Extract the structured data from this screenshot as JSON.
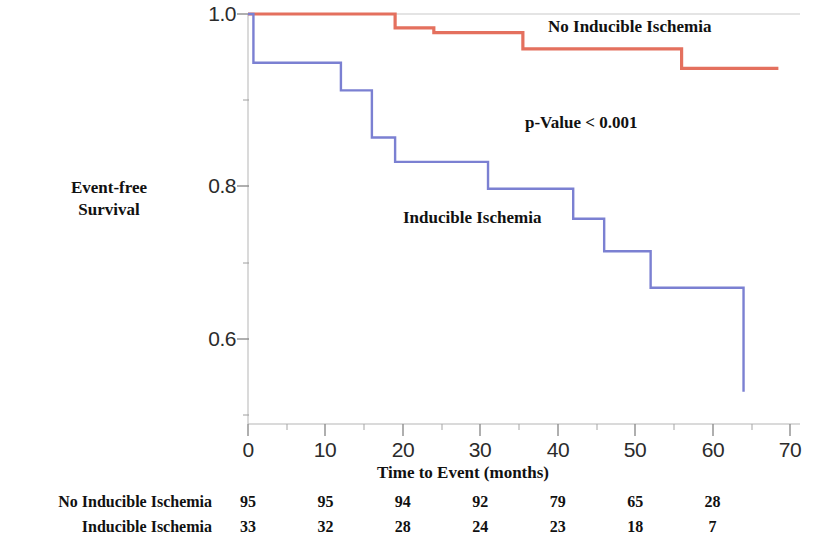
{
  "chart_data": {
    "type": "line",
    "subtype": "kaplan-meier-step",
    "title": "",
    "xlabel": "Time to Event (months)",
    "ylabel": "Event-free Survival",
    "ylabel_lines": [
      "Event-free",
      "Survival"
    ],
    "xlim": [
      0,
      70
    ],
    "ylim": [
      0.52,
      1.0
    ],
    "xticks": [
      0,
      10,
      20,
      30,
      40,
      50,
      60,
      70
    ],
    "xtick_labels": [
      "0",
      "10",
      "20",
      "30",
      "40",
      "50",
      "60",
      "70"
    ],
    "yticks": [
      0.6,
      0.8,
      1.0
    ],
    "ytick_labels": [
      "0.6",
      "0.8",
      "1.0"
    ],
    "y_minor_ticks": [
      0.7,
      0.9
    ],
    "grid": false,
    "legend_position": "in-plot-annotations",
    "annotations": [
      {
        "name": "no-inducible-ischemia-label",
        "text": "No Inducible Ischemia",
        "x": 39,
        "y": 0.978
      },
      {
        "name": "p-value-label",
        "text": "p-Value < 0.001",
        "x": 36,
        "y": 0.862
      },
      {
        "name": "inducible-ischemia-label",
        "text": "Inducible Ischemia",
        "x": 20,
        "y": 0.745
      }
    ],
    "series": [
      {
        "name": "No Inducible Ischemia",
        "color": "#e4705e",
        "x": [
          0,
          19,
          19,
          24,
          24,
          35.5,
          35.5,
          56,
          56,
          68.5
        ],
        "y": [
          1.0,
          1.0,
          0.983,
          0.983,
          0.977,
          0.977,
          0.957,
          0.957,
          0.933,
          0.933
        ],
        "steps": [
          {
            "time": 0,
            "survival": 1.0
          },
          {
            "time": 19,
            "survival": 0.983
          },
          {
            "time": 24,
            "survival": 0.977
          },
          {
            "time": 35.5,
            "survival": 0.957
          },
          {
            "time": 56,
            "survival": 0.933
          }
        ]
      },
      {
        "name": "Inducible Ischemia",
        "color": "#7b80d2",
        "x": [
          0,
          0.7,
          0.7,
          12,
          12,
          16,
          16,
          19,
          19,
          31,
          31,
          42,
          42,
          46,
          46,
          52,
          52,
          64,
          64
        ],
        "y": [
          1.0,
          1.0,
          0.94,
          0.94,
          0.906,
          0.906,
          0.848,
          0.848,
          0.818,
          0.818,
          0.785,
          0.785,
          0.748,
          0.748,
          0.708,
          0.708,
          0.663,
          0.663,
          0.535
        ],
        "steps": [
          {
            "time": 0,
            "survival": 1.0
          },
          {
            "time": 0.7,
            "survival": 0.94
          },
          {
            "time": 12,
            "survival": 0.906
          },
          {
            "time": 16,
            "survival": 0.848
          },
          {
            "time": 19,
            "survival": 0.818
          },
          {
            "time": 31,
            "survival": 0.785
          },
          {
            "time": 42,
            "survival": 0.748
          },
          {
            "time": 46,
            "survival": 0.708
          },
          {
            "time": 52,
            "survival": 0.663
          },
          {
            "time": 64,
            "survival": 0.535
          }
        ]
      }
    ],
    "p_value_text": "p-Value < 0.001",
    "risk_table": {
      "times": [
        0,
        10,
        20,
        30,
        40,
        50,
        60
      ],
      "rows": [
        {
          "label": "No Inducible Ischemia",
          "values": [
            "95",
            "95",
            "94",
            "92",
            "79",
            "65",
            "28"
          ]
        },
        {
          "label": "Inducible Ischemia",
          "values": [
            "33",
            "32",
            "28",
            "24",
            "23",
            "18",
            "7"
          ]
        }
      ]
    }
  },
  "axis": {
    "ytick_0": "1.0",
    "ytick_1": "0.8",
    "ytick_2": "0.6",
    "xtick_0": "0",
    "xtick_1": "10",
    "xtick_2": "20",
    "xtick_3": "30",
    "xtick_4": "40",
    "xtick_5": "50",
    "xtick_6": "60",
    "xtick_7": "70",
    "xlabel": "Time to Event (months)",
    "ylabel_line1": "Event-free",
    "ylabel_line2": "Survival"
  },
  "annotations": {
    "no_inducible": "No Inducible Ischemia",
    "p_value": "p-Value < 0.001",
    "inducible": "Inducible Ischemia"
  },
  "colors": {
    "no_inducible_ischemia": "#e4705e",
    "inducible_ischemia": "#7b80d2",
    "axis": "#9a9a9a",
    "text": "#111111",
    "background": "#ffffff"
  }
}
